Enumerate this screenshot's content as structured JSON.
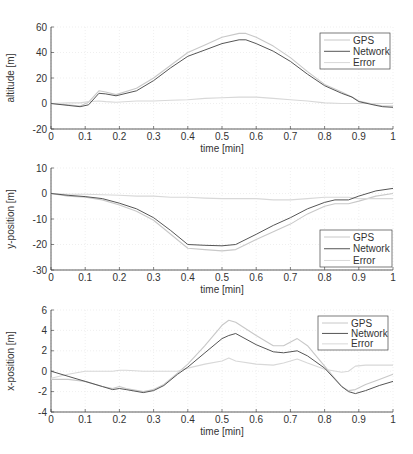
{
  "chart_data": [
    {
      "type": "line",
      "title": "",
      "xlabel": "time [min]",
      "ylabel": "altitude [m]",
      "xlim": [
        0,
        1
      ],
      "ylim": [
        -20,
        60
      ],
      "xticks": [
        "0",
        "0.1",
        "0.2",
        "0.3",
        "0.4",
        "0.5",
        "0.6",
        "0.7",
        "0.8",
        "0.9",
        "1"
      ],
      "yticks": [
        "-20",
        "0",
        "20",
        "40",
        "60"
      ],
      "grid": true,
      "legend_position": "top-right",
      "x": [
        0,
        0.05,
        0.085,
        0.11,
        0.14,
        0.16,
        0.19,
        0.25,
        0.3,
        0.35,
        0.4,
        0.45,
        0.5,
        0.55,
        0.57,
        0.6,
        0.65,
        0.7,
        0.75,
        0.8,
        0.85,
        0.88,
        0.9,
        0.95,
        0.97,
        1.0
      ],
      "series": [
        {
          "name": "GPS",
          "color": "#c8c8c8",
          "values": [
            0,
            -1,
            -2,
            1,
            10,
            9,
            7,
            12,
            20,
            30,
            40,
            46,
            52,
            55,
            55,
            52,
            45,
            36,
            25,
            15,
            9,
            5,
            2,
            -1,
            -2,
            -2
          ]
        },
        {
          "name": "Network",
          "color": "#555555",
          "values": [
            0,
            -1.5,
            -2.5,
            -1,
            8,
            7.5,
            6,
            10,
            18,
            28,
            37,
            42,
            47,
            50,
            50,
            47,
            41,
            33,
            23,
            14,
            8,
            5,
            1.5,
            -1.5,
            -2.5,
            -3
          ]
        },
        {
          "name": "Error",
          "color": "#d8d8d8",
          "values": [
            0,
            0.5,
            0.5,
            1.5,
            2,
            1.5,
            1,
            2,
            2,
            2.5,
            3,
            4,
            4.5,
            5,
            5,
            5,
            4,
            3,
            2,
            0.5,
            0,
            0,
            0,
            0,
            0,
            0
          ]
        }
      ]
    },
    {
      "type": "line",
      "title": "",
      "xlabel": "time [min]",
      "ylabel": "y-position [m]",
      "xlim": [
        0,
        1
      ],
      "ylim": [
        -30,
        10
      ],
      "xticks": [
        "0",
        "0.1",
        "0.2",
        "0.3",
        "0.4",
        "0.5",
        "0.6",
        "0.7",
        "0.8",
        "0.9",
        "1"
      ],
      "yticks": [
        "-30",
        "-20",
        "-10",
        "0",
        "10"
      ],
      "grid": true,
      "legend_position": "bottom-right",
      "x": [
        0,
        0.05,
        0.1,
        0.15,
        0.2,
        0.25,
        0.3,
        0.35,
        0.4,
        0.45,
        0.5,
        0.54,
        0.6,
        0.65,
        0.7,
        0.75,
        0.8,
        0.83,
        0.87,
        0.9,
        0.95,
        1.0
      ],
      "series": [
        {
          "name": "GPS",
          "color": "#c8c8c8",
          "values": [
            0,
            -1,
            -1.5,
            -2.5,
            -4.5,
            -7,
            -10.5,
            -16,
            -21.5,
            -22,
            -22.5,
            -22,
            -18,
            -15,
            -12,
            -8,
            -5,
            -4,
            -4,
            -3,
            -1,
            0
          ]
        },
        {
          "name": "Network",
          "color": "#555555",
          "values": [
            0,
            -0.7,
            -1.2,
            -2,
            -3.8,
            -6,
            -9.5,
            -14.5,
            -20,
            -20.3,
            -20.5,
            -20,
            -16,
            -12.5,
            -9.5,
            -6,
            -3.5,
            -2.5,
            -2.5,
            -1,
            1,
            2
          ]
        },
        {
          "name": "Error",
          "color": "#d8d8d8",
          "values": [
            0,
            -0.3,
            -0.3,
            -0.5,
            -0.7,
            -1,
            -1,
            -1.5,
            -1.5,
            -1.8,
            -2,
            -2,
            -2,
            -2.5,
            -2.5,
            -2,
            -1.5,
            -1.5,
            -1.5,
            -2,
            -2,
            -2
          ]
        }
      ]
    },
    {
      "type": "line",
      "title": "",
      "xlabel": "time [min]",
      "ylabel": "x-position [m]",
      "xlim": [
        0,
        1
      ],
      "ylim": [
        -4,
        6
      ],
      "xticks": [
        "0",
        "0.1",
        "0.2",
        "0.3",
        "0.4",
        "0.5",
        "0.6",
        "0.7",
        "0.8",
        "0.9",
        "1"
      ],
      "yticks": [
        "-4",
        "-2",
        "0",
        "2",
        "4",
        "6"
      ],
      "grid": true,
      "legend_position": "top-right",
      "x": [
        0,
        0.05,
        0.1,
        0.15,
        0.18,
        0.2,
        0.22,
        0.27,
        0.3,
        0.33,
        0.37,
        0.4,
        0.45,
        0.5,
        0.52,
        0.54,
        0.6,
        0.65,
        0.68,
        0.72,
        0.75,
        0.8,
        0.85,
        0.87,
        0.89,
        0.92,
        0.96,
        1.0
      ],
      "series": [
        {
          "name": "GPS",
          "color": "#c8c8c8",
          "values": [
            -0.8,
            -0.8,
            -1,
            -1.5,
            -1.7,
            -1.5,
            -1.7,
            -2,
            -1.8,
            -1.3,
            -0.2,
            0.7,
            2.5,
            4.5,
            5,
            4.8,
            3.5,
            2.5,
            2.5,
            3.2,
            2.5,
            0.5,
            -1.5,
            -1.9,
            -1.8,
            -1.3,
            -0.8,
            -0.3
          ]
        },
        {
          "name": "Network",
          "color": "#555555",
          "values": [
            0,
            -0.5,
            -1,
            -1.5,
            -1.8,
            -1.7,
            -1.8,
            -2.1,
            -1.9,
            -1.4,
            -0.3,
            0.4,
            1.8,
            3.2,
            3.5,
            3.7,
            2.6,
            1.9,
            1.8,
            2,
            1.5,
            0.3,
            -1.5,
            -2,
            -2.2,
            -1.9,
            -1.4,
            -1
          ]
        },
        {
          "name": "Error",
          "color": "#d8d8d8",
          "values": [
            -0.7,
            -0.3,
            0,
            0,
            0,
            0.1,
            0.1,
            0,
            0,
            0,
            0,
            0.3,
            0.7,
            1,
            1.3,
            1,
            0.7,
            0.6,
            0.8,
            1.2,
            0.8,
            0.2,
            -0.1,
            0,
            0.5,
            0.6,
            0.6,
            0.6
          ]
        }
      ]
    }
  ]
}
